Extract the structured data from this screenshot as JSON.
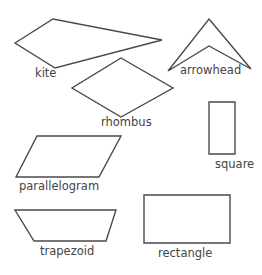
{
  "stroke_color": "#4a4a4a",
  "label_color": "#444444",
  "shapes": [
    {
      "name": "kite",
      "label": "kite",
      "points": "15,43 53,19 162,40 55,68",
      "label_pos": [
        35,
        68
      ]
    },
    {
      "name": "arrowhead",
      "label": "arrowhead",
      "points": "209,19 251,69 209,46 168,71",
      "label_pos": [
        180,
        65
      ]
    },
    {
      "name": "rhombus",
      "label": "rhombus",
      "points": "121,58 173,88 121,117 72,88",
      "label_pos": [
        101,
        117
      ]
    },
    {
      "name": "parallelogram",
      "label": "parallelogram",
      "points": "37,136 121,136 99,177 16,177",
      "label_pos": [
        19,
        181
      ]
    },
    {
      "name": "square",
      "label": "square",
      "points": "209,102 235,102 235,154 209,154",
      "label_pos": [
        215,
        159
      ]
    },
    {
      "name": "trapezoid",
      "label": "trapezoid",
      "points": "15,210 116,210 106,241 34,241",
      "label_pos": [
        40,
        246
      ]
    },
    {
      "name": "rectangle",
      "label": "rectangle",
      "points": "144,195 230,195 230,243 144,243",
      "label_pos": [
        158,
        248
      ]
    }
  ]
}
